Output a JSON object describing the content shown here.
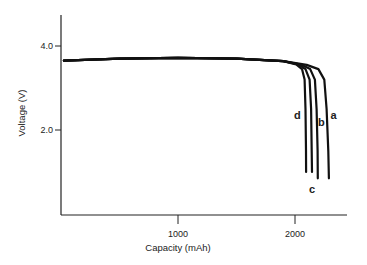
{
  "chart_data": {
    "type": "line",
    "title": "",
    "xlabel": "Capacity (mAh)",
    "ylabel": "Voltage (V)",
    "xlim": [
      0,
      2450
    ],
    "ylim": [
      0,
      4.8
    ],
    "x_ticks": [
      {
        "value": 1000,
        "label": "1000"
      },
      {
        "value": 2000,
        "label": "2000"
      }
    ],
    "y_ticks": [
      {
        "value": 2.0,
        "label": "2.0"
      },
      {
        "value": 4.0,
        "label": "4.0"
      }
    ],
    "grid": false,
    "legend": "inline curve labels",
    "series": [
      {
        "name": "a",
        "x": [
          25,
          500,
          1000,
          1500,
          1900,
          2100,
          2200,
          2250,
          2270,
          2285,
          2290
        ],
        "y": [
          3.65,
          3.7,
          3.72,
          3.7,
          3.64,
          3.55,
          3.45,
          3.2,
          2.5,
          1.5,
          0.85
        ]
      },
      {
        "name": "b",
        "x": [
          25,
          500,
          1000,
          1500,
          1900,
          2050,
          2130,
          2170,
          2185,
          2193,
          2195
        ],
        "y": [
          3.65,
          3.7,
          3.72,
          3.7,
          3.64,
          3.56,
          3.45,
          3.2,
          2.5,
          1.5,
          0.85
        ]
      },
      {
        "name": "c",
        "x": [
          25,
          500,
          1000,
          1500,
          1900,
          2030,
          2090,
          2125,
          2138,
          2143,
          2145
        ],
        "y": [
          3.65,
          3.7,
          3.72,
          3.7,
          3.64,
          3.56,
          3.45,
          3.2,
          2.5,
          1.5,
          1.0
        ]
      },
      {
        "name": "d",
        "x": [
          25,
          500,
          1000,
          1500,
          1900,
          2010,
          2060,
          2082,
          2090,
          2094,
          2095
        ],
        "y": [
          3.65,
          3.7,
          3.72,
          3.7,
          3.64,
          3.56,
          3.45,
          3.2,
          2.5,
          1.5,
          1.0
        ]
      }
    ],
    "annotations": [
      {
        "text": "a",
        "x": 2330,
        "y": 2.35
      },
      {
        "text": "b",
        "x": 2225,
        "y": 2.2
      },
      {
        "text": "c",
        "x": 2145,
        "y": 0.6
      },
      {
        "text": "d",
        "x": 2020,
        "y": 2.35
      }
    ]
  }
}
